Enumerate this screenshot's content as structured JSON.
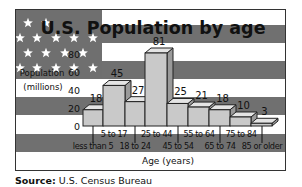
{
  "chart_data": {
    "type": "bar",
    "title": "U.S. Population by age",
    "ylabel": "Population (millions)",
    "ylabel_line1": "Population",
    "ylabel_line2": "(millions)",
    "xlabel": "Age (years)",
    "ylim": [
      0,
      80
    ],
    "yticks": [
      0,
      20,
      40,
      60,
      80
    ],
    "grid": false,
    "legend": "none",
    "style": "3d bars over U.S. flag background",
    "categories": [
      "less than 5",
      "5 to 17",
      "18 to 24",
      "25 to 44",
      "45 to 54",
      "55 to 64",
      "65 to 74",
      "75 to 84",
      "85 or older"
    ],
    "values": [
      18,
      45,
      27,
      81,
      25,
      21,
      18,
      10,
      3
    ]
  },
  "source": {
    "label": "Source:",
    "text": "U.S. Census Bureau"
  },
  "colors": {
    "dark_stripe": "#707070",
    "light_stripe": "#ffffff",
    "union": "#6f6f6f",
    "bar_front": "#c9c9c9",
    "bar_top": "#e4e4e4",
    "bar_side": "#9a9a9a",
    "text": "#111111"
  }
}
